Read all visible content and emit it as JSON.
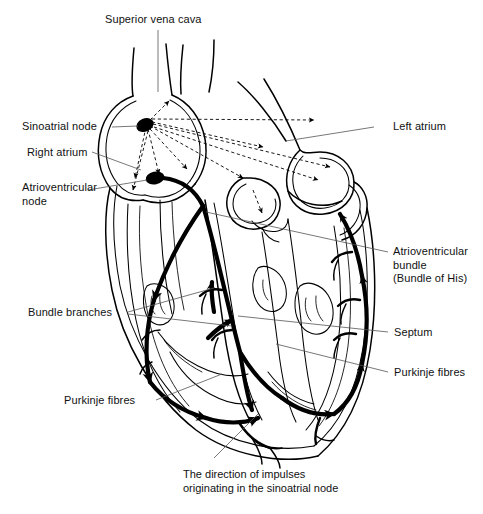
{
  "figure": {
    "title_text": "Superior vena cava",
    "background_color": "#ffffff",
    "ink_color": "#000000",
    "leader_color": "#555555"
  },
  "labels": {
    "superior_vena_cava": "Superior vena cava",
    "sinoatrial_node": "Sinoatrial node",
    "right_atrium": "Right atrium",
    "atrioventricular_node_line1": "Atrioventricular",
    "atrioventricular_node_line2": "node",
    "left_atrium": "Left atrium",
    "av_bundle_line1": "Atrioventricular",
    "av_bundle_line2": "bundle",
    "av_bundle_line3": "(Bundle of His)",
    "bundle_branches": "Bundle branches",
    "septum": "Septum",
    "purkinje_fibres_left": "Purkinje fibres",
    "purkinje_fibres_right": "Purkinje fibres"
  },
  "caption": {
    "line1": "The direction of impulses",
    "line2": "originating in the sinoatrial node"
  },
  "structures": [
    {
      "name": "superior-vena-cava",
      "kind": "vessel"
    },
    {
      "name": "sinoatrial-node",
      "kind": "node",
      "marker": "filled-ellipse"
    },
    {
      "name": "atrioventricular-node",
      "kind": "node",
      "marker": "filled-ellipse"
    },
    {
      "name": "right-atrium",
      "kind": "chamber"
    },
    {
      "name": "left-atrium",
      "kind": "chamber"
    },
    {
      "name": "atrioventricular-bundle",
      "kind": "conduction-path"
    },
    {
      "name": "bundle-branches",
      "kind": "conduction-path"
    },
    {
      "name": "septum",
      "kind": "wall"
    },
    {
      "name": "purkinje-fibres",
      "kind": "conduction-path"
    },
    {
      "name": "impulse-rays",
      "kind": "dashed-arrows"
    }
  ]
}
